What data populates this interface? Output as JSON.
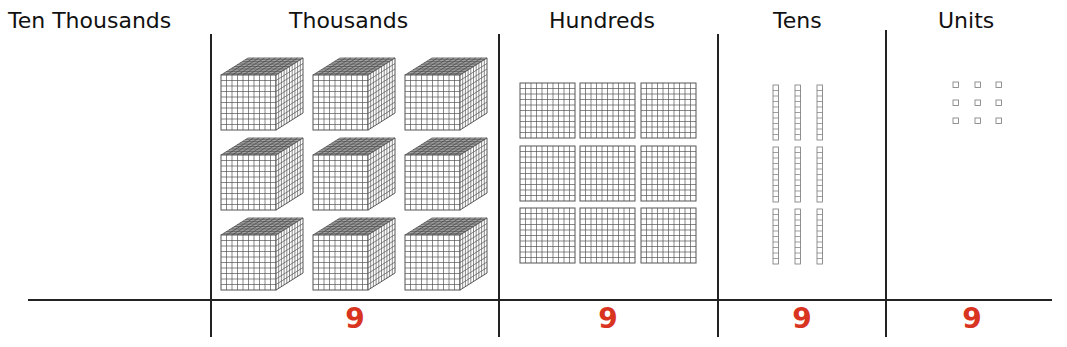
{
  "columns": [
    {
      "key": "ten_thousands",
      "label": "Ten Thousands",
      "digit": ""
    },
    {
      "key": "thousands",
      "label": "Thousands",
      "digit": "9"
    },
    {
      "key": "hundreds",
      "label": "Hundreds",
      "digit": "9"
    },
    {
      "key": "tens",
      "label": "Tens",
      "digit": "9"
    },
    {
      "key": "units",
      "label": "Units",
      "digit": "9"
    }
  ],
  "blocks": {
    "thousands_count": 9,
    "hundreds_count": 9,
    "tens_count": 9,
    "units_count": 9
  },
  "colors": {
    "digit": "#d9341f",
    "line": "#222222",
    "grid": "#555555"
  }
}
